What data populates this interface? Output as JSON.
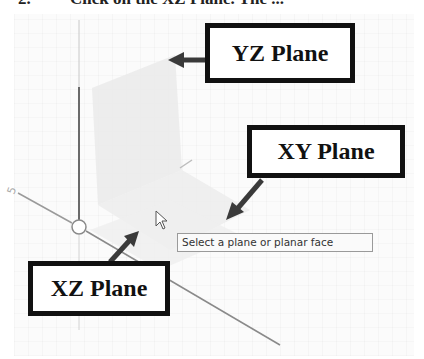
{
  "instruction": {
    "step_number": "2.",
    "text": "Click on the XZ Plane. The ..."
  },
  "viewport": {
    "background": "#fbfbfb",
    "axis_label_fragment": "5",
    "tooltip": "Select a plane or planar face"
  },
  "callouts": [
    {
      "id": "yz",
      "label": "YZ Plane"
    },
    {
      "id": "xy",
      "label": "XY Plane"
    },
    {
      "id": "xz",
      "label": "XZ Plane"
    }
  ],
  "colors": {
    "callout_border": "#111111",
    "arrow": "#3a3a3a",
    "plane_fill": "#e9e9e9",
    "axis_line": "#6a6a6a"
  }
}
